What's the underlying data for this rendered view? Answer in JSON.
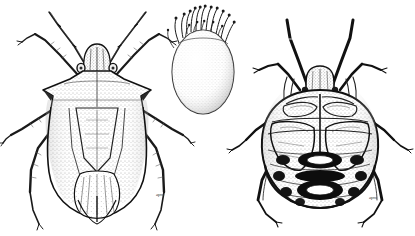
{
  "plate": {
    "title": "Stink bug life stages plate",
    "description": "Pen-and-ink scientific illustration of three life stages of a shield bug (Pentatomidae) on a plain white background.",
    "background_color": "#ffffff",
    "ink_color": "#1a1a1a",
    "stipple_color": "#555555",
    "width": 415,
    "height": 236,
    "medium": "pen-and-ink stipple line drawing"
  },
  "figures": [
    {
      "id": "adult",
      "label": "Adult stink bug, dorsal view",
      "position": "left",
      "center_x": 97,
      "center_y": 125,
      "body_width": 120,
      "body_height": 200,
      "features": [
        "shield-shaped body",
        "pointed humeral angles on pronotum",
        "large triangular scutellum",
        "stippled corium with venation",
        "membranous hemelytra tips overlapping at apex",
        "five-segmented antennae",
        "three pairs of long legs"
      ],
      "signature": "artist"
    },
    {
      "id": "egg",
      "label": "Egg with micropylar processes",
      "position": "center",
      "center_x": 203,
      "center_y": 70,
      "body_width": 62,
      "body_height": 88,
      "spine_count": 17,
      "features": [
        "barrel / ovoid shaped chorion",
        "dense stippled surface texture",
        "ring of club-tipped micropylar processes at the operculum rim"
      ]
    },
    {
      "id": "nymph",
      "label": "Nymph, dorsal view",
      "position": "right",
      "center_x": 320,
      "center_y": 130,
      "body_width": 110,
      "body_height": 185,
      "features": [
        "rounded oval abdomen",
        "black dorsal abdominal scent-gland plates",
        "developing wing pads",
        "thick dark antennae spread upward",
        "small narrow head"
      ],
      "signature": "artist"
    }
  ],
  "signatures": [
    {
      "id": "sig-adult",
      "text": "apm",
      "x": 160,
      "y": 196
    },
    {
      "id": "sig-nymph",
      "text": "apm",
      "x": 372,
      "y": 199
    }
  ]
}
